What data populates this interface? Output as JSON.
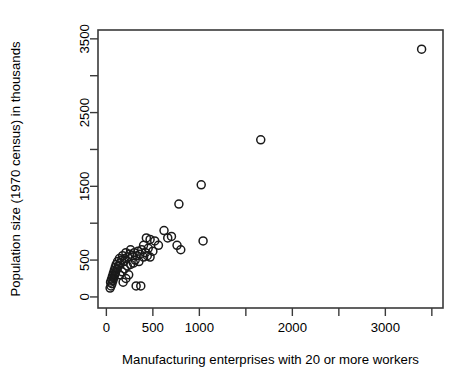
{
  "chart_data": {
    "type": "scatter",
    "title": "",
    "xlabel": "Manufacturing enterprises with 20 or more workers",
    "ylabel": "Population size (1970 census) in thousands",
    "xlim": [
      -90,
      3620
    ],
    "ylim": [
      -150,
      3620
    ],
    "xticks": [
      0,
      500,
      1000,
      1500,
      2000,
      2500,
      3000,
      3500
    ],
    "xtick_labels": [
      "0",
      "500",
      "1000",
      "",
      "2000",
      "",
      "3000",
      ""
    ],
    "yticks": [
      0,
      500,
      1000,
      1500,
      2000,
      2500,
      3000,
      3500
    ],
    "ytick_labels": [
      "0",
      "500",
      "",
      "1500",
      "",
      "2500",
      "",
      "3500"
    ],
    "grid": false,
    "legend": null,
    "marker": "open-circle",
    "marker_color": "#1a1a1a",
    "points": [
      {
        "x": 3390,
        "y": 3360
      },
      {
        "x": 1660,
        "y": 2130
      },
      {
        "x": 1020,
        "y": 1520
      },
      {
        "x": 780,
        "y": 1260
      },
      {
        "x": 1040,
        "y": 760
      },
      {
        "x": 700,
        "y": 820
      },
      {
        "x": 660,
        "y": 800
      },
      {
        "x": 760,
        "y": 700
      },
      {
        "x": 800,
        "y": 640
      },
      {
        "x": 620,
        "y": 900
      },
      {
        "x": 560,
        "y": 700
      },
      {
        "x": 520,
        "y": 760
      },
      {
        "x": 470,
        "y": 780
      },
      {
        "x": 430,
        "y": 800
      },
      {
        "x": 400,
        "y": 700
      },
      {
        "x": 450,
        "y": 660
      },
      {
        "x": 500,
        "y": 620
      },
      {
        "x": 420,
        "y": 600
      },
      {
        "x": 380,
        "y": 640
      },
      {
        "x": 360,
        "y": 580
      },
      {
        "x": 340,
        "y": 620
      },
      {
        "x": 330,
        "y": 560
      },
      {
        "x": 400,
        "y": 540
      },
      {
        "x": 440,
        "y": 560
      },
      {
        "x": 470,
        "y": 540
      },
      {
        "x": 300,
        "y": 600
      },
      {
        "x": 280,
        "y": 560
      },
      {
        "x": 260,
        "y": 640
      },
      {
        "x": 250,
        "y": 580
      },
      {
        "x": 230,
        "y": 540
      },
      {
        "x": 210,
        "y": 600
      },
      {
        "x": 200,
        "y": 520
      },
      {
        "x": 190,
        "y": 480
      },
      {
        "x": 175,
        "y": 560
      },
      {
        "x": 165,
        "y": 500
      },
      {
        "x": 150,
        "y": 460
      },
      {
        "x": 140,
        "y": 520
      },
      {
        "x": 130,
        "y": 420
      },
      {
        "x": 120,
        "y": 480
      },
      {
        "x": 115,
        "y": 380
      },
      {
        "x": 105,
        "y": 440
      },
      {
        "x": 100,
        "y": 340
      },
      {
        "x": 95,
        "y": 400
      },
      {
        "x": 90,
        "y": 300
      },
      {
        "x": 85,
        "y": 360
      },
      {
        "x": 80,
        "y": 260
      },
      {
        "x": 75,
        "y": 320
      },
      {
        "x": 70,
        "y": 220
      },
      {
        "x": 65,
        "y": 280
      },
      {
        "x": 60,
        "y": 180
      },
      {
        "x": 55,
        "y": 240
      },
      {
        "x": 50,
        "y": 150
      },
      {
        "x": 45,
        "y": 200
      },
      {
        "x": 40,
        "y": 120
      },
      {
        "x": 260,
        "y": 440
      },
      {
        "x": 290,
        "y": 460
      },
      {
        "x": 310,
        "y": 500
      },
      {
        "x": 350,
        "y": 480
      },
      {
        "x": 225,
        "y": 420
      },
      {
        "x": 195,
        "y": 380
      },
      {
        "x": 170,
        "y": 340
      },
      {
        "x": 145,
        "y": 300
      },
      {
        "x": 320,
        "y": 150
      },
      {
        "x": 370,
        "y": 150
      },
      {
        "x": 210,
        "y": 250
      },
      {
        "x": 180,
        "y": 200
      },
      {
        "x": 240,
        "y": 300
      }
    ]
  }
}
